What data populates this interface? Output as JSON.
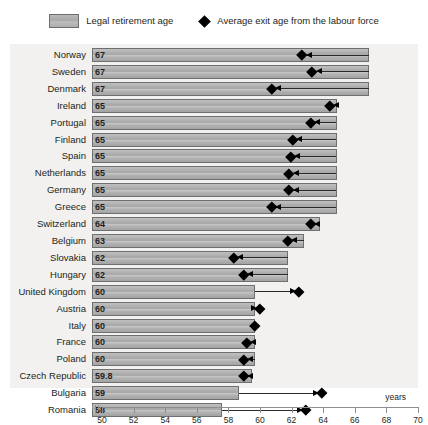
{
  "legend": {
    "bar_label": "Legal retirement age",
    "marker_label": "Average exit age from the labour force",
    "bar_icon": "legend-swatch-icon",
    "marker_icon": "diamond-marker-icon"
  },
  "axis": {
    "unit_label": "years",
    "ticks": [
      "50",
      "52",
      "54",
      "56",
      "58",
      "60",
      "62",
      "64",
      "66",
      "68",
      "70"
    ]
  },
  "chart_data": {
    "type": "bar",
    "title": "",
    "subtitle": "",
    "xlabel": "years",
    "ylabel": "",
    "xlim": [
      50,
      70
    ],
    "xticks": [
      50,
      52,
      54,
      56,
      58,
      60,
      62,
      64,
      66,
      68,
      70
    ],
    "grid": false,
    "legend_position": "top-center",
    "orientation": "horizontal",
    "categories": [
      "Norway",
      "Sweden",
      "Denmark",
      "Ireland",
      "Portugal",
      "Finland",
      "Spain",
      "Netherlands",
      "Germany",
      "Greece",
      "Switzerland",
      "Belgium",
      "Slovakia",
      "Hungary",
      "United Kingdom",
      "Austria",
      "Italy",
      "France",
      "Poland",
      "Czech Republic",
      "Bulgaria",
      "Romania"
    ],
    "series": [
      {
        "name": "Legal retirement age",
        "values": [
          67,
          67,
          67,
          65,
          65,
          65,
          65,
          65,
          65,
          65,
          64,
          63,
          62,
          62,
          60,
          60,
          60,
          60,
          60,
          59.8,
          59,
          58
        ]
      },
      {
        "name": "Average exit age from the labour force",
        "values": [
          62.9,
          63.5,
          61.0,
          64.6,
          63.4,
          62.3,
          62.2,
          62.1,
          62.1,
          61.0,
          63.4,
          62.0,
          58.7,
          59.3,
          62.7,
          60.3,
          60.0,
          59.5,
          59.3,
          59.3,
          64.1,
          63.1
        ]
      }
    ],
    "bar_labels": [
      "67",
      "67",
      "67",
      "65",
      "65",
      "65",
      "65",
      "65",
      "65",
      "65",
      "64",
      "63",
      "62",
      "62",
      "60",
      "60",
      "60",
      "60",
      "60",
      "59.8",
      "59",
      "58"
    ]
  },
  "colors": {
    "bar_fill": "#b3b3b3",
    "bar_stroke": "#6f6f6f",
    "marker": "#000000",
    "plot_background": "#f2f1ef",
    "text": "#231f20",
    "axis": "#8e8e8e"
  }
}
